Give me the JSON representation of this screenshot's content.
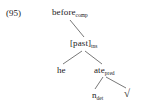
{
  "figure": {
    "example_number": "(95)",
    "type": "syntax-tree"
  },
  "tree": {
    "root": {
      "label": "before",
      "subscript": "comp"
    },
    "tense": {
      "label": "[past]",
      "subscript": "tns"
    },
    "subject": {
      "label": "he",
      "subscript": ""
    },
    "predicate": {
      "label": "ate",
      "subscript": "pred"
    },
    "determiner": {
      "label": "n",
      "subscript": "det"
    },
    "root_sign": {
      "label": "√",
      "subscript": ""
    }
  },
  "colors": {
    "background": "#ffffff",
    "text": "#1a1a1a",
    "line": "#555555"
  }
}
